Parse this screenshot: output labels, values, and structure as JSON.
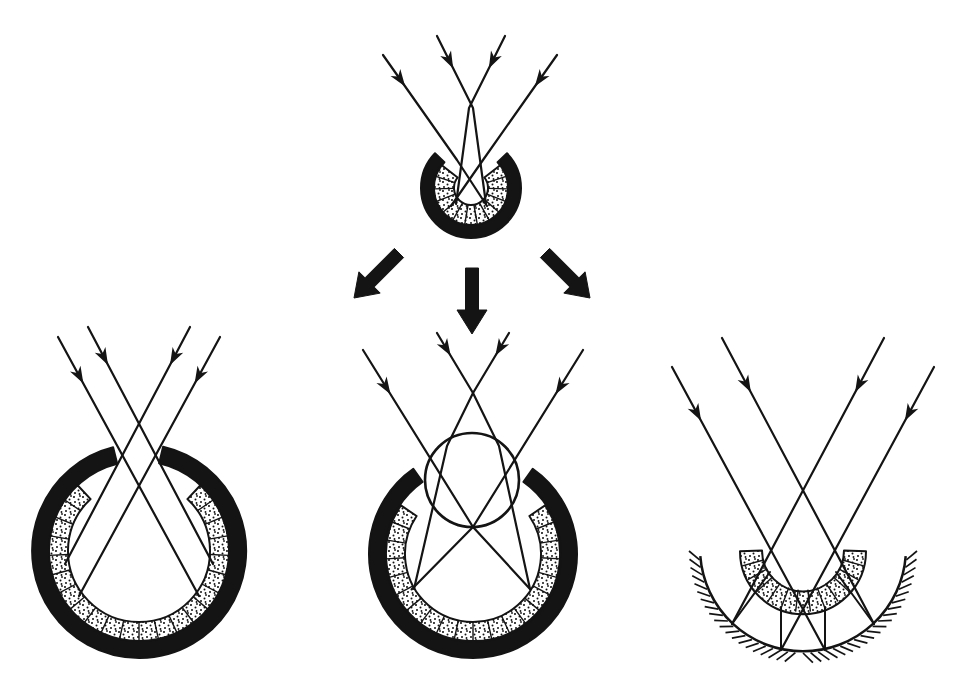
{
  "canvas": {
    "w": 974,
    "h": 686,
    "bg": "#ffffff",
    "ink": "#141414"
  },
  "strokes": {
    "ray": 2.2,
    "band": 2.0,
    "cell": 1.4,
    "lens": 2.6,
    "mirror": 2.5,
    "tick": 1.7,
    "reflection": 2.0
  },
  "arrowhead": {
    "len": 17,
    "half_width": 6,
    "notch": 0.72
  },
  "flow_arrows": [
    {
      "id": "arrow-to-pinhole-eye",
      "from": [
        399,
        253
      ],
      "tip": [
        354,
        298
      ],
      "shaft_width": 13,
      "head_length": 22,
      "head_width": 30
    },
    {
      "id": "arrow-to-lens-eye",
      "from": [
        472,
        268
      ],
      "tip": [
        472,
        334
      ],
      "shaft_width": 13,
      "head_length": 24,
      "head_width": 30
    },
    {
      "id": "arrow-to-mirror-eye",
      "from": [
        545,
        253
      ],
      "tip": [
        590,
        298
      ],
      "shaft_width": 13,
      "head_length": 22,
      "head_width": 30
    }
  ],
  "panels": [
    {
      "id": "cup-eye",
      "bands": [
        {
          "kind": "pigment-band",
          "cx": 471,
          "cy": 188,
          "rO": 50,
          "rI": 37,
          "a1": 46,
          "a2": 314,
          "fill": "ink"
        },
        {
          "kind": "retina-band",
          "cx": 471,
          "cy": 188,
          "rO": 37,
          "rI": 17,
          "a1": 52,
          "a2": 308,
          "fill": "dots",
          "cells": 13
        }
      ],
      "rays": [
        {
          "pts": [
            [
              383,
              55
            ],
            [
              457,
              160
            ],
            [
              487,
              206
            ]
          ],
          "arrow": {
            "seg": 0,
            "t": 0.3
          }
        },
        {
          "pts": [
            [
              437,
              36
            ],
            [
              473,
              108
            ],
            [
              486,
              204
            ]
          ],
          "arrow": {
            "seg": 0,
            "t": 0.45
          }
        },
        {
          "pts": [
            [
              505,
              36
            ],
            [
              469,
              108
            ],
            [
              456,
              204
            ]
          ],
          "arrow": {
            "seg": 0,
            "t": 0.45
          }
        },
        {
          "pts": [
            [
              557,
              55
            ],
            [
              483,
              160
            ],
            [
              451,
              206
            ]
          ],
          "arrow": {
            "seg": 0,
            "t": 0.3
          }
        }
      ]
    },
    {
      "id": "pinhole-eye",
      "bands": [
        {
          "kind": "pigment-band",
          "cx": 139,
          "cy": 551,
          "rO": 107,
          "rI": 90,
          "a1": 13,
          "a2": 346,
          "fill": "ink"
        },
        {
          "kind": "retina-band",
          "cx": 139,
          "cy": 551,
          "rO": 90,
          "rI": 71,
          "a1": 43,
          "a2": 317,
          "fill": "dots",
          "cells": 22
        }
      ],
      "rays": [
        {
          "pts": [
            [
              58,
              337
            ],
            [
              199,
              596
            ]
          ],
          "arrow": {
            "seg": 0,
            "t": 0.18
          }
        },
        {
          "pts": [
            [
              88,
              327
            ],
            [
              213,
              564
            ]
          ],
          "arrow": {
            "seg": 0,
            "t": 0.16
          }
        },
        {
          "pts": [
            [
              190,
              327
            ],
            [
              65,
              564
            ]
          ],
          "arrow": {
            "seg": 0,
            "t": 0.16
          }
        },
        {
          "pts": [
            [
              220,
              337
            ],
            [
              79,
              596
            ]
          ],
          "arrow": {
            "seg": 0,
            "t": 0.18
          }
        }
      ]
    },
    {
      "id": "lens-eye",
      "bands": [
        {
          "kind": "pigment-band",
          "cx": 473,
          "cy": 554,
          "rO": 104,
          "rI": 88,
          "a1": 35,
          "a2": 325,
          "fill": "ink"
        },
        {
          "kind": "retina-band",
          "cx": 473,
          "cy": 554,
          "rO": 87,
          "rI": 68,
          "a1": 56,
          "a2": 304,
          "fill": "dots",
          "cells": 20
        }
      ],
      "lens": {
        "cx": 472,
        "cy": 480,
        "r": 47
      },
      "rays": [
        {
          "pts": [
            [
              363,
              350
            ],
            [
              473,
              527
            ],
            [
              530,
              589
            ]
          ],
          "arrow": {
            "seg": 0,
            "t": 0.25
          }
        },
        {
          "pts": [
            [
              437,
              333
            ],
            [
              473,
              393
            ],
            [
              499,
              446
            ],
            [
              530,
              589
            ]
          ],
          "arrow": {
            "seg": 0,
            "t": 0.38
          }
        },
        {
          "pts": [
            [
              509,
              333
            ],
            [
              473,
              393
            ],
            [
              447,
              446
            ],
            [
              414,
              589
            ]
          ],
          "arrow": {
            "seg": 0,
            "t": 0.38
          }
        },
        {
          "pts": [
            [
              583,
              350
            ],
            [
              473,
              527
            ],
            [
              412,
              589
            ]
          ],
          "arrow": {
            "seg": 0,
            "t": 0.25
          }
        }
      ]
    },
    {
      "id": "mirror-eye",
      "bands": [
        {
          "kind": "retina-band",
          "cx": 803,
          "cy": 549,
          "rO": 63,
          "rI": 41,
          "a1": 92,
          "a2": 268,
          "fill": "dots",
          "cells": 13
        }
      ],
      "mirror": {
        "cx": 803,
        "cy": 549,
        "r": 103,
        "a1": 94,
        "a2": 266,
        "tick_len": 11,
        "tick_step": 4.2,
        "tick_skew": 5
      },
      "rays": [
        {
          "pts": [
            [
              672,
              367
            ],
            [
              825,
              650
            ]
          ],
          "arrow": {
            "seg": 0,
            "t": 0.19
          }
        },
        {
          "pts": [
            [
              722,
              338
            ],
            [
              874,
              624
            ]
          ],
          "arrow": {
            "seg": 0,
            "t": 0.19
          }
        },
        {
          "pts": [
            [
              884,
              338
            ],
            [
              732,
              624
            ]
          ],
          "arrow": {
            "seg": 0,
            "t": 0.19
          }
        },
        {
          "pts": [
            [
              934,
              367
            ],
            [
              781,
              650
            ]
          ],
          "arrow": {
            "seg": 0,
            "t": 0.19
          }
        }
      ],
      "reflections": [
        {
          "pts": [
            [
              732,
              624
            ],
            [
              770,
              572
            ]
          ]
        },
        {
          "pts": [
            [
              781,
              650
            ],
            [
              781,
              607
            ]
          ]
        },
        {
          "pts": [
            [
              825,
              650
            ],
            [
              825,
              607
            ]
          ]
        },
        {
          "pts": [
            [
              874,
              624
            ],
            [
              836,
              572
            ]
          ]
        }
      ]
    }
  ]
}
